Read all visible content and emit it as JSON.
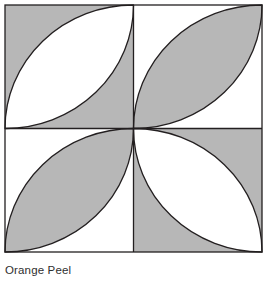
{
  "figure": {
    "caption": "Orange Peel",
    "title": "Orange Peel",
    "kind": "quilt-block-diagram"
  },
  "colors": {
    "shaded": "#b7b7b7",
    "unshaded": "#ffffff",
    "outline": "#231f20",
    "caption_text": "#2f2f2f",
    "page_background": "#ffffff"
  },
  "geometry": {
    "square_left": 5,
    "square_top": 5,
    "square_right": 262,
    "square_bottom": 252,
    "center_x": 133.5,
    "center_y": 128.5,
    "grid_rows": 2,
    "grid_cols": 2,
    "outline_width": 1.3,
    "divider_width": 1.3
  },
  "quadrants": [
    {
      "id": "top-left",
      "petal_fill": "unshaded",
      "background_fill": "shaded",
      "petal_axis": "anti-diagonal",
      "arc_endpoints": [
        "top-right-corner",
        "bottom-left-corner"
      ]
    },
    {
      "id": "top-right",
      "petal_fill": "shaded",
      "background_fill": "unshaded",
      "petal_axis": "main-diagonal",
      "arc_endpoints": [
        "top-left-corner",
        "bottom-right-corner"
      ]
    },
    {
      "id": "bottom-left",
      "petal_fill": "shaded",
      "background_fill": "unshaded",
      "petal_axis": "main-diagonal",
      "arc_endpoints": [
        "top-left-corner",
        "bottom-right-corner"
      ]
    },
    {
      "id": "bottom-right",
      "petal_fill": "unshaded",
      "background_fill": "shaded",
      "petal_axis": "anti-diagonal",
      "arc_endpoints": [
        "top-right-corner",
        "bottom-left-corner"
      ]
    }
  ]
}
